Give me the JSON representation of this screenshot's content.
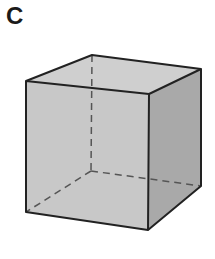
{
  "panel": {
    "label": "C"
  },
  "figure": {
    "colors": {
      "front": "#c8c8c8",
      "top": "#cfcfcf",
      "right": "#a9a9a9",
      "edge": "#222222",
      "hidden_edge": "#555555"
    }
  }
}
